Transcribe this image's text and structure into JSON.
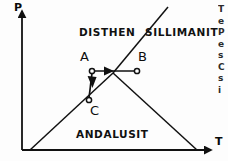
{
  "figure": {
    "kind": "phase-diagram",
    "background_color": "#fdfdfd",
    "line_color": "#111111",
    "axes": {
      "y_label": "P",
      "x_label": "T",
      "origin_px": [
        22,
        150
      ],
      "y_top_px": [
        22,
        10
      ],
      "x_right_px": [
        212,
        150
      ]
    },
    "fields": [
      {
        "id": "disthen",
        "label": "DISTHEN"
      },
      {
        "id": "sillimanit",
        "label": "SILLIMANIT"
      },
      {
        "id": "andalusit",
        "label": "ANDALUSIT"
      }
    ],
    "points": [
      {
        "id": "A",
        "label": "A",
        "px": [
          92,
          71
        ]
      },
      {
        "id": "B",
        "label": "B",
        "px": [
          137,
          71
        ]
      },
      {
        "id": "C",
        "label": "C",
        "px": [
          89,
          100
        ]
      }
    ],
    "arrows": [
      {
        "id": "A-to-B",
        "from": "A",
        "to": "B",
        "direction": "right"
      },
      {
        "id": "A-to-C",
        "from": "A",
        "to": "C",
        "direction": "down"
      }
    ]
  },
  "chart_data": {
    "type": "line",
    "title": "",
    "subtitle": "",
    "xlabel": "T",
    "ylabel": "P",
    "grid": false,
    "legend": "none",
    "xlim": [
      0,
      228
    ],
    "ylim": [
      0,
      161
    ],
    "annotations": [
      "DISTHEN",
      "SILLIMANIT",
      "ANDALUSIT",
      "A",
      "B",
      "C",
      "P",
      "T"
    ],
    "triple_point": [
      113,
      73
    ],
    "series": [
      {
        "name": "kyanite-sillimanite boundary",
        "x": [
          113,
          168
        ],
        "y": [
          73,
          8
        ]
      },
      {
        "name": "kyanite-andalusite boundary",
        "x": [
          30,
          113
        ],
        "y": [
          150,
          73
        ]
      },
      {
        "name": "andalusite-sillimanite boundary",
        "x": [
          113,
          196
        ],
        "y": [
          73,
          150
        ]
      },
      {
        "name": "path A to B (isobaric heating)",
        "x": [
          92,
          137
        ],
        "y": [
          71,
          71
        ]
      },
      {
        "name": "path A to C (isothermal decompression)",
        "x": [
          92,
          89
        ],
        "y": [
          71,
          100
        ]
      }
    ]
  },
  "margin_text": {
    "lines": [
      "T",
      "e",
      "P",
      "e",
      "s",
      "C",
      "s",
      "i"
    ]
  }
}
